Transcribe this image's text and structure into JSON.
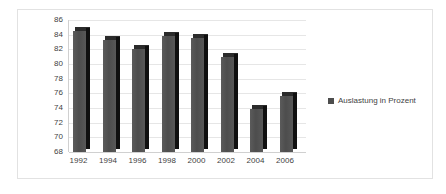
{
  "legend": {
    "position": "right",
    "entries": [
      {
        "label": "Auslastung in Prozent",
        "color": "#4d4d4d",
        "marker": "square-swatch"
      }
    ]
  },
  "axes": {
    "y_ticks": [
      "86",
      "84",
      "82",
      "80",
      "78",
      "76",
      "74",
      "72",
      "70",
      "68"
    ],
    "x_ticks": [
      "1992",
      "1994",
      "1996",
      "1998",
      "2000",
      "2002",
      "2004",
      "2006"
    ]
  },
  "chart_data": {
    "type": "bar",
    "title": "",
    "subtitle": "",
    "xlabel": "",
    "ylabel": "",
    "categories": [
      "1992",
      "1994",
      "1996",
      "1998",
      "2000",
      "2002",
      "2004",
      "2006"
    ],
    "series": [
      {
        "name": "Auslastung in Prozent",
        "color": "#4d4d4d",
        "values": [
          84.5,
          83.3,
          82.1,
          83.8,
          83.5,
          81.0,
          73.9,
          75.6
        ]
      }
    ],
    "values": [
      84.5,
      83.3,
      82.1,
      83.8,
      83.5,
      81.0,
      73.9,
      75.6
    ],
    "ylim": [
      68,
      86
    ],
    "ytick_step": 2,
    "grid": true,
    "grid_axis": "y",
    "legend_position": "right",
    "style": "3d-column",
    "background": "#ffffff"
  }
}
